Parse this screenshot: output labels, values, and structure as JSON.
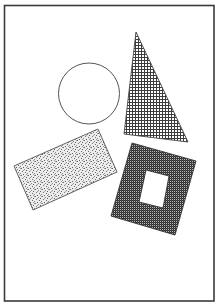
{
  "diagram": {
    "width": 219,
    "height": 308,
    "background": "#ffffff",
    "frame": {
      "x": 4.5,
      "y": 5.5,
      "width": 209.5,
      "height": 295.5,
      "stroke": "#3a3a3a",
      "stroke_width": 1.6
    },
    "shapes": [
      {
        "id": "circle",
        "type": "circle",
        "cx": 89,
        "cy": 93.5,
        "r": 30.5,
        "fill": "none",
        "stroke": "#555555",
        "stroke_width": 1
      },
      {
        "id": "triangle",
        "type": "polygon",
        "points": "136,32 124,134 188,142",
        "fill_pattern": "grid",
        "stroke": "#444444",
        "stroke_width": 0.9
      },
      {
        "id": "rectangle",
        "type": "polygon",
        "points": "14,166 98,129 117,172 33,210",
        "fill_pattern": "stipple",
        "stroke": "#555555",
        "stroke_width": 0.9
      },
      {
        "id": "square-frame",
        "type": "polygon-with-hole",
        "outer_points": "132,143 196,161 175,235 111,216",
        "inner_points": "146,170 169,176 163,208 139,202",
        "fill_pattern": "checker",
        "stroke": "#333333",
        "stroke_width": 0.9
      }
    ],
    "patterns": {
      "grid": {
        "bg": "#ffffff",
        "line": "#3c3c3c",
        "cell": 3
      },
      "checker": {
        "dark": "#2e2e2e",
        "light": "#bdbdbd",
        "cell": 2
      },
      "stipple": {
        "bg": "#ececec",
        "dot": "#6a6a6a"
      }
    }
  }
}
